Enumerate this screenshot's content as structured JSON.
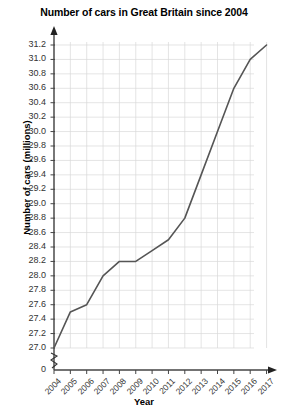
{
  "chart_data": {
    "type": "line",
    "title": "Number of cars in Great Britain since 2004",
    "xlabel": "Year",
    "ylabel": "Number of cars (millions)",
    "x": [
      2004,
      2005,
      2006,
      2007,
      2008,
      2009,
      2010,
      2011,
      2012,
      2013,
      2014,
      2015,
      2016,
      2017
    ],
    "categories": [
      "2004",
      "2005",
      "2006",
      "2007",
      "2008",
      "2009",
      "2010",
      "2011",
      "2012",
      "2013",
      "2014",
      "2015",
      "2016",
      "2017"
    ],
    "values": [
      27.0,
      27.5,
      27.6,
      28.0,
      28.2,
      28.2,
      28.35,
      28.5,
      28.8,
      29.4,
      30.0,
      30.6,
      31.0,
      31.2
    ],
    "series": [
      {
        "name": "Number of cars",
        "values": [
          27.0,
          27.5,
          27.6,
          28.0,
          28.2,
          28.2,
          28.35,
          28.5,
          28.8,
          29.4,
          30.0,
          30.6,
          31.0,
          31.2
        ]
      }
    ],
    "ylim": [
      27.0,
      31.2
    ],
    "xlim": [
      2004,
      2017
    ],
    "ytick_labels": [
      "31.2",
      "31.0",
      "30.8",
      "30.6",
      "30.4",
      "30.2",
      "30.0",
      "29.8",
      "29.6",
      "29.4",
      "29.2",
      "29.0",
      "28.8",
      "28.6",
      "28.4",
      "28.2",
      "28.0",
      "27.8",
      "27.6",
      "27.4",
      "27.2",
      "27.0"
    ],
    "ytick_values": [
      31.2,
      31.0,
      30.8,
      30.6,
      30.4,
      30.2,
      30.0,
      29.8,
      29.6,
      29.4,
      29.2,
      29.0,
      28.8,
      28.6,
      28.4,
      28.2,
      28.0,
      27.8,
      27.6,
      27.4,
      27.2,
      27.0
    ],
    "y_origin_label": "0",
    "axis_break": true,
    "grid": true,
    "legend": null,
    "line_color": "#555555",
    "grid_color": "#d8d8d8",
    "axis_color": "#444444"
  }
}
